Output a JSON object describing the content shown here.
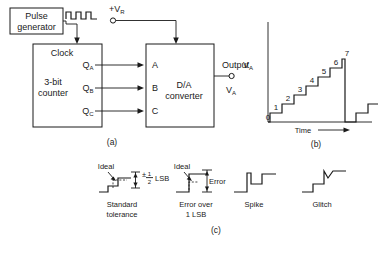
{
  "figure": {
    "title_parts": [
      "(a)",
      "(b)",
      "(c)"
    ],
    "captions": {
      "a": "(a)",
      "b": "(b)",
      "c": "(c)"
    }
  },
  "circuit": {
    "pulse_generator": {
      "line1": "Pulse",
      "line2": "generator"
    },
    "counter": {
      "clock_label": "Clock",
      "line1": "3-bit",
      "line2": "counter"
    },
    "counter_outputs": [
      "Q",
      "Q",
      "Q"
    ],
    "counter_output_subs": [
      "A",
      "B",
      "C"
    ],
    "dac": {
      "line1": "D/A",
      "line2": "converter"
    },
    "dac_inputs": [
      "A",
      "B",
      "C"
    ],
    "reference": {
      "sign": "+V",
      "sub": "R"
    },
    "output": {
      "label": "Output",
      "signal": "V",
      "signal_sub": "A"
    },
    "waveform_name": "clock-pulse-train",
    "pulse_count": 3
  },
  "staircase": {
    "y_axis_label": "V",
    "y_axis_sub": "A",
    "x_axis_label": "Time",
    "step_labels": [
      "0",
      "1",
      "2",
      "3",
      "4",
      "5",
      "6",
      "7"
    ],
    "step_count": 8,
    "reset_note": "reset-to-zero-then-restart"
  },
  "errors": {
    "items": [
      {
        "name": "standard-tolerance",
        "caption_line1": "Standard",
        "caption_line2": "tolerance",
        "ideal_label": "Ideal",
        "tolerance_sign": "±",
        "tolerance_num": "1",
        "tolerance_den": "2",
        "tolerance_unit": "LSB"
      },
      {
        "name": "error-over-1-lsb",
        "caption_line1": "Error over",
        "caption_line2": "1 LSB",
        "ideal_label": "Ideal",
        "error_label": "Error"
      },
      {
        "name": "spike",
        "caption_line1": "Spike",
        "caption_line2": ""
      },
      {
        "name": "glitch",
        "caption_line1": "Glitch",
        "caption_line2": ""
      }
    ]
  },
  "colors": {
    "ink": "#1a1a1a",
    "background": "#ffffff"
  }
}
